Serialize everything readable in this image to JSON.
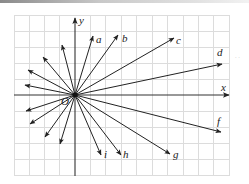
{
  "figure": {
    "type": "vector-fan-on-grid",
    "origin_label": "O",
    "axes": {
      "x_label": "x",
      "y_label": "y"
    },
    "colors": {
      "grid": "#dcdcdc",
      "axis": "#333333",
      "vector": "#222222",
      "background": "#ffffff"
    },
    "labeled_vectors": [
      {
        "label": "a"
      },
      {
        "label": "b"
      },
      {
        "label": "c"
      },
      {
        "label": "d"
      },
      {
        "label": "f"
      },
      {
        "label": "g"
      },
      {
        "label": "h"
      },
      {
        "label": "i"
      }
    ],
    "unlabeled_vector_count": 8
  }
}
